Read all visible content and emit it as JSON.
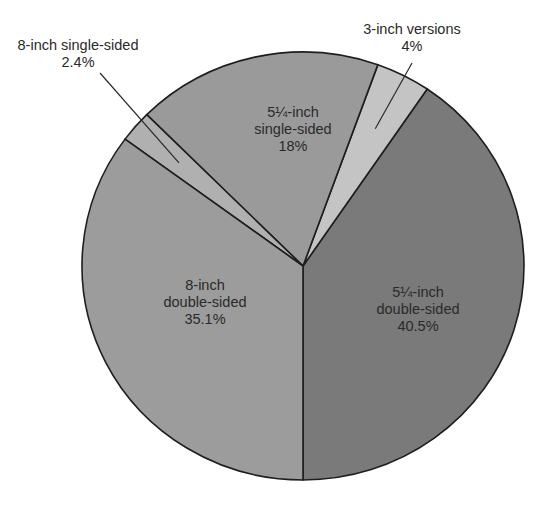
{
  "chart_data": {
    "type": "pie",
    "title": "",
    "start": "bottom",
    "direction": "counterclockwise",
    "slices": [
      {
        "label_lines": [
          "5¼-inch",
          "double-sided",
          "40.5%"
        ],
        "name": "5¼-inch double-sided",
        "value": 40.5,
        "color": "#7a7a7a",
        "label_position": "inside"
      },
      {
        "label_lines": [
          "3-inch versions",
          "4%"
        ],
        "name": "3-inch versions",
        "value": 4,
        "color": "#c4c4c4",
        "label_position": "outside"
      },
      {
        "label_lines": [
          "5¼-inch",
          "single-sided",
          "18%"
        ],
        "name": "5¼-inch single-sided",
        "value": 18,
        "color": "#9a9a9a",
        "label_position": "inside"
      },
      {
        "label_lines": [
          "8-inch single-sided",
          "2.4%"
        ],
        "name": "8-inch single-sided",
        "value": 2.4,
        "color": "#b0b0b0",
        "label_position": "outside"
      },
      {
        "label_lines": [
          "8-inch",
          "double-sided",
          "35.1%"
        ],
        "name": "8-inch double-sided",
        "value": 35.1,
        "color": "#9c9c9c",
        "label_position": "inside"
      }
    ],
    "units": "%"
  }
}
